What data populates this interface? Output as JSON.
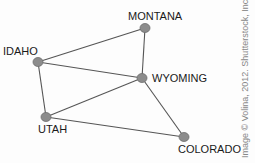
{
  "graph": {
    "nodes": [
      {
        "id": "idaho",
        "label": "IDAHO",
        "x": 38,
        "y": 62,
        "lx": 3,
        "ly": 55
      },
      {
        "id": "montana",
        "label": "MONTANA",
        "x": 145,
        "y": 28,
        "lx": 128,
        "ly": 20
      },
      {
        "id": "wyoming",
        "label": "WYOMING",
        "x": 142,
        "y": 78,
        "lx": 152,
        "ly": 82
      },
      {
        "id": "utah",
        "label": "UTAH",
        "x": 46,
        "y": 117,
        "lx": 38,
        "ly": 133
      },
      {
        "id": "colorado",
        "label": "COLORADO",
        "x": 184,
        "y": 137,
        "lx": 178,
        "ly": 153
      }
    ],
    "edges": [
      [
        "idaho",
        "montana"
      ],
      [
        "idaho",
        "wyoming"
      ],
      [
        "idaho",
        "utah"
      ],
      [
        "montana",
        "wyoming"
      ],
      [
        "wyoming",
        "utah"
      ],
      [
        "wyoming",
        "colorado"
      ],
      [
        "utah",
        "colorado"
      ]
    ]
  },
  "credit": "Image © Volina, 2012. Shutterstock, Inc."
}
